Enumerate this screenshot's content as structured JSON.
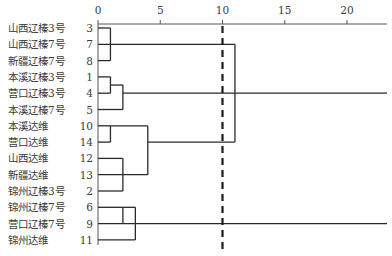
{
  "chart_data": {
    "type": "dendrogram",
    "title": "",
    "xlabel": "",
    "ylabel": "",
    "x_axis": {
      "position": "top",
      "ticks": [
        0,
        5,
        10,
        15,
        20
      ],
      "range": [
        0,
        23.2
      ]
    },
    "threshold_line": {
      "value": 10,
      "style": "dashed"
    },
    "leaves": [
      {
        "name": "山西辽榛3号",
        "id": "3"
      },
      {
        "name": "山西辽榛7号",
        "id": "7"
      },
      {
        "name": "新疆辽榛7号",
        "id": "8"
      },
      {
        "name": "本溪辽榛3号",
        "id": "1"
      },
      {
        "name": "营口辽榛3号",
        "id": "4"
      },
      {
        "name": "本溪辽榛7号",
        "id": "5"
      },
      {
        "name": "本溪达维",
        "id": "10"
      },
      {
        "name": "营口达维",
        "id": "14"
      },
      {
        "name": "山西达维",
        "id": "12"
      },
      {
        "name": "新疆达维",
        "id": "13"
      },
      {
        "name": "锦州辽榛3号",
        "id": "2"
      },
      {
        "name": "锦州辽榛7号",
        "id": "6"
      },
      {
        "name": "营口辽榛7号",
        "id": "9"
      },
      {
        "name": "锦州达维",
        "id": "11"
      }
    ],
    "merges": [
      {
        "members": [
          "3",
          "7",
          "8"
        ],
        "distance": 1
      },
      {
        "members": [
          "1",
          "4"
        ],
        "distance": 1
      },
      {
        "members": [
          "1",
          "4",
          "5"
        ],
        "distance": 2
      },
      {
        "members": [
          "10",
          "14"
        ],
        "distance": 1
      },
      {
        "members": [
          "12",
          "13",
          "2"
        ],
        "distance": 2
      },
      {
        "members": [
          "10",
          "14",
          "12",
          "13",
          "2"
        ],
        "distance": 4
      },
      {
        "members": [
          "3",
          "7",
          "8",
          "10",
          "14",
          "12",
          "13",
          "2"
        ],
        "distance": 11
      },
      {
        "members": [
          "6",
          "9"
        ],
        "distance": 2
      },
      {
        "members": [
          "6",
          "9",
          "11"
        ],
        "distance": 3
      }
    ],
    "open_branches_to_edge": [
      {
        "members": [
          "1",
          "4",
          "5"
        ],
        "from_distance": 2
      },
      {
        "members": [
          "6",
          "9",
          "11"
        ],
        "from_distance": 3
      }
    ],
    "grid": false,
    "legend": null
  }
}
